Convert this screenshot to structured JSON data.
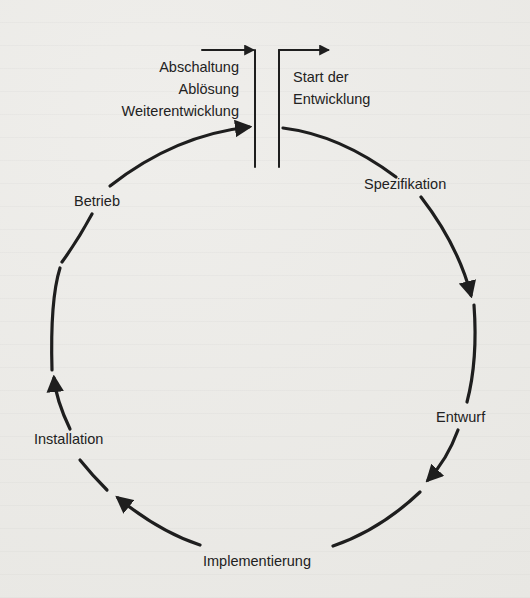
{
  "diagram": {
    "type": "software-lifecycle-cycle",
    "exit_block": {
      "lines": [
        "Abschaltung",
        "Ablösung",
        "Weiterentwicklung"
      ]
    },
    "start_block": {
      "lines": [
        "Start der",
        "Entwicklung"
      ]
    },
    "phases": [
      {
        "id": "spezifikation",
        "label": "Spezifikation"
      },
      {
        "id": "entwurf",
        "label": "Entwurf"
      },
      {
        "id": "implementierung",
        "label": "Implementierung"
      },
      {
        "id": "installation",
        "label": "Installation"
      },
      {
        "id": "betrieb",
        "label": "Betrieb"
      }
    ],
    "flow_direction": "clockwise",
    "colors": {
      "stroke": "#1e1e1e",
      "text": "#222222",
      "paper": "#ecebe8"
    }
  }
}
